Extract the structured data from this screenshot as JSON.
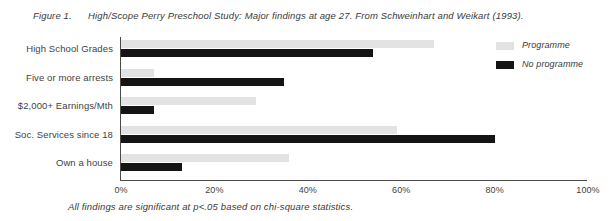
{
  "caption": {
    "figure_number": "Figure 1.",
    "text": "High/Scope Perry Preschool Study: Major findings at age 27.  From Schweinhart and Weikart (1993)."
  },
  "footnote": {
    "text": "All findings are significant at p<.05 based on chi-square statistics."
  },
  "legend": {
    "position": "top-right",
    "items": [
      {
        "label": "Programme",
        "color": "#e3e3e3"
      },
      {
        "label": "No programme",
        "color": "#141414"
      }
    ]
  },
  "chart_data": {
    "type": "bar",
    "orientation": "horizontal",
    "title": "High/Scope Perry Preschool Study: Major findings at age 27.",
    "xlabel": "",
    "ylabel": "",
    "xlim": [
      0,
      100
    ],
    "xticks": [
      "0%",
      "20%",
      "40%",
      "60%",
      "80%",
      "100%"
    ],
    "xtick_values": [
      0,
      20,
      40,
      60,
      80,
      100
    ],
    "grid": false,
    "categories": [
      "High School Grades",
      "Five or more arrests",
      "$2,000+ Earnings/Mth",
      "Soc. Services since 18",
      "Own a house"
    ],
    "series": [
      {
        "name": "Programme",
        "color": "#e3e3e3",
        "values": [
          67,
          7,
          29,
          59,
          36
        ]
      },
      {
        "name": "No programme",
        "color": "#141414",
        "values": [
          54,
          35,
          7,
          80,
          13
        ]
      }
    ]
  }
}
